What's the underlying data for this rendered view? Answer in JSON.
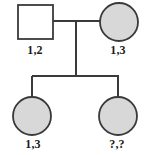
{
  "diagram": {
    "type": "pedigree-chart",
    "title": "",
    "background_color": "#ffffff",
    "stroke_color": "#333333",
    "shaded_fill": "#d8d8d8",
    "unshaded_fill": "#ffffff",
    "label_color": "#1b1b1b",
    "generations": 2,
    "symbol_legend": {
      "square": "male",
      "circle": "female",
      "filled": "shaded-affected",
      "unfilled": "unshaded-unaffected"
    },
    "individuals": [
      {
        "id": "I-1",
        "generation": 1,
        "sex": "male",
        "shape": "square",
        "shaded": false,
        "genotype": "1,2",
        "cx": 35,
        "cy": 22,
        "size": 35
      },
      {
        "id": "I-2",
        "generation": 1,
        "sex": "female",
        "shape": "circle",
        "shaded": true,
        "genotype": "1,3",
        "cx": 119,
        "cy": 22,
        "r": 19
      },
      {
        "id": "II-1",
        "generation": 2,
        "sex": "female",
        "shape": "circle",
        "shaded": true,
        "genotype": "1,3",
        "cx": 32,
        "cy": 116,
        "r": 19
      },
      {
        "id": "II-2",
        "generation": 2,
        "sex": "female",
        "shape": "circle",
        "shaded": true,
        "genotype": "?,?",
        "cx": 118,
        "cy": 116,
        "r": 19
      }
    ],
    "connections": {
      "mating_line": {
        "x1": 52,
        "y1": 21,
        "x2": 100,
        "y2": 21
      },
      "descent_line": {
        "x": 76,
        "y1": 21,
        "y2": 76
      },
      "sibship_line": {
        "x1": 32,
        "y": 76,
        "x2": 118
      },
      "child_drop_left": {
        "x": 32,
        "y1": 76,
        "y2": 97
      },
      "child_drop_right": {
        "x": 118,
        "y1": 76,
        "y2": 97
      }
    },
    "labels": {
      "father_genotype": "1,2",
      "mother_genotype": "1,3",
      "child1_genotype": "1,3",
      "child2_genotype": "?,?"
    }
  }
}
